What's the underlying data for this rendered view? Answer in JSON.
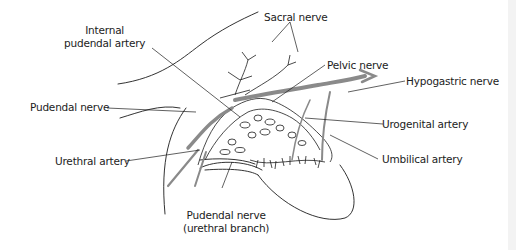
{
  "figure": {
    "type": "anatomical-diagram",
    "colors": {
      "line": "#1c1c1c",
      "artery_fill": "#8a8a8a",
      "background": "#ffffff"
    }
  },
  "labels": {
    "internal_pudendal_artery": [
      "Internal",
      "pudendal artery"
    ],
    "sacral_nerve": "Sacral nerve",
    "pelvic_nerve": "Pelvic nerve",
    "hypogastric_nerve": "Hypogastric nerve",
    "pudendal_nerve": "Pudendal nerve",
    "urogenital_artery": "Urogenital artery",
    "urethral_artery": "Urethral artery",
    "umbilical_artery": "Umbilical artery",
    "pudendal_nerve_urethral_branch": [
      "Pudendal nerve",
      "(urethral branch)"
    ]
  }
}
